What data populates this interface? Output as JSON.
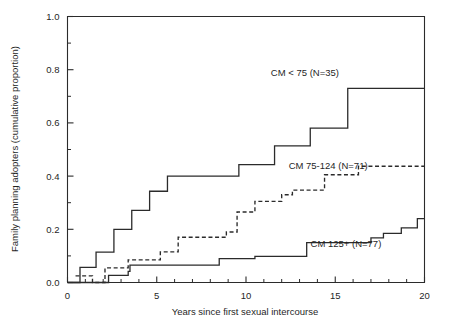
{
  "chart_data": {
    "type": "line",
    "subtype": "step-kaplan-meier-cumulative-incidence",
    "title": "",
    "xlabel": "Years since first sexual intercourse",
    "ylabel": "Family planning adopters (cumulative proportion)",
    "xlim": [
      0,
      20
    ],
    "ylim": [
      0.0,
      1.0
    ],
    "grid": false,
    "legend_position": "inline-annotations",
    "x_ticks_major": [
      0,
      5,
      10,
      15,
      20
    ],
    "x_tick_labels": [
      "0",
      "5",
      "10",
      "15",
      "20"
    ],
    "x_ticks_minor": [
      1,
      2,
      3,
      4,
      6,
      7,
      8,
      9,
      11,
      12,
      13,
      14,
      16,
      17,
      18,
      19
    ],
    "y_ticks_major": [
      0.0,
      0.2,
      0.4,
      0.6,
      0.8,
      1.0
    ],
    "y_tick_labels": [
      "0.0",
      "0.2",
      "0.4",
      "0.6",
      "0.8",
      "1.0"
    ],
    "y_ticks_minor": [
      0.1,
      0.3,
      0.5,
      0.7,
      0.9
    ],
    "series": [
      {
        "name": "CM < 75 (N=35)",
        "label": "CM < 75 (N=35)",
        "n": 35,
        "style": "solid",
        "color": "#2b2b2b",
        "annotation": {
          "text": "CM < 75 (N=35)",
          "x": 13.3,
          "y": 0.775
        },
        "steps": [
          {
            "x": 0.0,
            "y": 0.0
          },
          {
            "x": 0.7,
            "y": 0.057
          },
          {
            "x": 1.5,
            "y": 0.057
          },
          {
            "x": 1.6,
            "y": 0.114
          },
          {
            "x": 2.5,
            "y": 0.114
          },
          {
            "x": 2.6,
            "y": 0.2
          },
          {
            "x": 3.5,
            "y": 0.2
          },
          {
            "x": 3.6,
            "y": 0.271
          },
          {
            "x": 4.5,
            "y": 0.271
          },
          {
            "x": 4.6,
            "y": 0.343
          },
          {
            "x": 5.5,
            "y": 0.343
          },
          {
            "x": 5.6,
            "y": 0.4
          },
          {
            "x": 9.5,
            "y": 0.4
          },
          {
            "x": 9.6,
            "y": 0.443
          },
          {
            "x": 11.5,
            "y": 0.443
          },
          {
            "x": 11.6,
            "y": 0.514
          },
          {
            "x": 13.5,
            "y": 0.514
          },
          {
            "x": 13.6,
            "y": 0.58
          },
          {
            "x": 15.6,
            "y": 0.58
          },
          {
            "x": 15.7,
            "y": 0.73
          },
          {
            "x": 20.0,
            "y": 0.73
          }
        ],
        "final_value": 0.73
      },
      {
        "name": "CM 75-124 (N=71)",
        "label": "CM 75-124 (N=71)",
        "n": 71,
        "style": "dashed",
        "color": "#2b2b2b",
        "annotation": {
          "text": "CM 75-124 (N=71)",
          "x": 14.6,
          "y": 0.425
        },
        "steps": [
          {
            "x": 0.45,
            "y": 0.025
          },
          {
            "x": 1.3,
            "y": 0.025
          },
          {
            "x": 1.4,
            "y": 0.0
          },
          {
            "x": 2.0,
            "y": 0.0
          },
          {
            "x": 2.1,
            "y": 0.055
          },
          {
            "x": 3.3,
            "y": 0.055
          },
          {
            "x": 3.4,
            "y": 0.085
          },
          {
            "x": 5.1,
            "y": 0.085
          },
          {
            "x": 5.2,
            "y": 0.115
          },
          {
            "x": 6.1,
            "y": 0.115
          },
          {
            "x": 6.2,
            "y": 0.17
          },
          {
            "x": 8.8,
            "y": 0.17
          },
          {
            "x": 8.9,
            "y": 0.19
          },
          {
            "x": 9.4,
            "y": 0.19
          },
          {
            "x": 9.5,
            "y": 0.265
          },
          {
            "x": 10.4,
            "y": 0.265
          },
          {
            "x": 10.5,
            "y": 0.305
          },
          {
            "x": 11.9,
            "y": 0.305
          },
          {
            "x": 12.0,
            "y": 0.33
          },
          {
            "x": 12.5,
            "y": 0.33
          },
          {
            "x": 12.6,
            "y": 0.347
          },
          {
            "x": 14.3,
            "y": 0.347
          },
          {
            "x": 14.4,
            "y": 0.405
          },
          {
            "x": 16.2,
            "y": 0.405
          },
          {
            "x": 16.3,
            "y": 0.437
          },
          {
            "x": 20.0,
            "y": 0.437
          }
        ],
        "final_value": 0.44
      },
      {
        "name": "CM 125+ (N=77)",
        "label": "CM 125+ (N=77)",
        "n": 77,
        "style": "solid",
        "color": "#2b2b2b",
        "annotation": {
          "text": "CM 125+ (N=77)",
          "x": 15.6,
          "y": 0.135
        },
        "steps": [
          {
            "x": 0.0,
            "y": 0.0
          },
          {
            "x": 2.2,
            "y": 0.0
          },
          {
            "x": 2.3,
            "y": 0.027
          },
          {
            "x": 3.3,
            "y": 0.027
          },
          {
            "x": 3.4,
            "y": 0.042
          },
          {
            "x": 3.5,
            "y": 0.065
          },
          {
            "x": 8.4,
            "y": 0.065
          },
          {
            "x": 8.5,
            "y": 0.09
          },
          {
            "x": 10.4,
            "y": 0.09
          },
          {
            "x": 10.5,
            "y": 0.098
          },
          {
            "x": 13.3,
            "y": 0.098
          },
          {
            "x": 13.4,
            "y": 0.15
          },
          {
            "x": 16.9,
            "y": 0.15
          },
          {
            "x": 17.0,
            "y": 0.168
          },
          {
            "x": 17.6,
            "y": 0.168
          },
          {
            "x": 17.7,
            "y": 0.185
          },
          {
            "x": 18.6,
            "y": 0.185
          },
          {
            "x": 18.7,
            "y": 0.205
          },
          {
            "x": 19.5,
            "y": 0.205
          },
          {
            "x": 19.6,
            "y": 0.24
          },
          {
            "x": 20.0,
            "y": 0.24
          }
        ],
        "final_value": 0.24
      }
    ]
  },
  "axes": {
    "x_title": "Years since first sexual intercourse",
    "y_title": "Family planning adopters (cumulative proportion)"
  }
}
